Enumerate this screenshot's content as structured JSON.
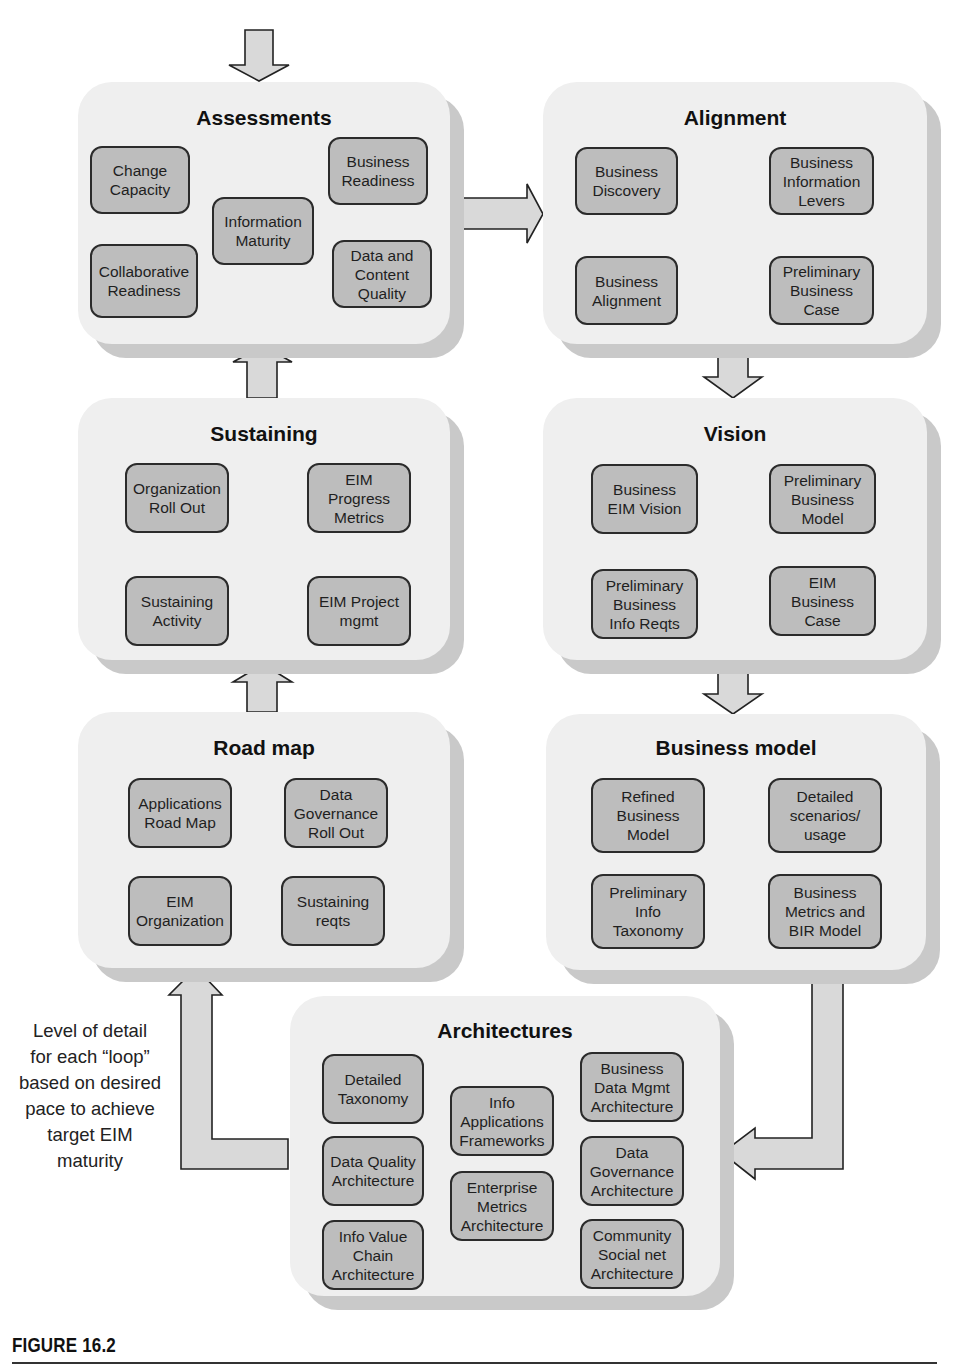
{
  "diagram": {
    "colors": {
      "panel_fill": "#efefef",
      "panel_shadow": "#c9c9c9",
      "node_fill": "#bdbdbd",
      "node_border": "#2b2b2b",
      "arrow_fill": "#d9d9d9",
      "arrow_stroke": "#222222"
    },
    "panels": {
      "assessments": {
        "title": "Assessments",
        "nodes": [
          "Change\nCapacity",
          "Collaborative\nReadiness",
          "Information\nMaturity",
          "Business\nReadiness",
          "Data and\nContent\nQuality"
        ]
      },
      "alignment": {
        "title": "Alignment",
        "nodes": [
          "Business\nDiscovery",
          "Business\nInformation\nLevers",
          "Business\nAlignment",
          "Preliminary\nBusiness\nCase"
        ]
      },
      "sustaining": {
        "title": "Sustaining",
        "nodes": [
          "Organization\nRoll Out",
          "EIM\nProgress\nMetrics",
          "Sustaining\nActivity",
          "EIM Project\nmgmt"
        ]
      },
      "vision": {
        "title": "Vision",
        "nodes": [
          "Business\nEIM Vision",
          "Preliminary\nBusiness\nModel",
          "Preliminary\nBusiness\nInfo Reqts",
          "EIM\nBusiness\nCase"
        ]
      },
      "roadmap": {
        "title": "Road map",
        "nodes": [
          "Applications\nRoad Map",
          "Data\nGovernance\nRoll Out",
          "EIM\nOrganization",
          "Sustaining\nreqts"
        ]
      },
      "business_model": {
        "title": "Business model",
        "nodes": [
          "Refined\nBusiness\nModel",
          "Detailed\nscenarios/\nusage",
          "Preliminary\nInfo\nTaxonomy",
          "Business\nMetrics and\nBIR Model"
        ]
      },
      "architectures": {
        "title": "Architectures",
        "nodes": [
          "Detailed\nTaxonomy",
          "Data Quality\nArchitecture",
          "Info Value\nChain\nArchitecture",
          "Info\nApplications\nFrameworks",
          "Enterprise\nMetrics\nArchitecture",
          "Business\nData Mgmt\nArchitecture",
          "Data\nGovernance\nArchitecture",
          "Community\nSocial net\nArchitecture"
        ]
      }
    },
    "flow": [
      "Assessments",
      "Alignment",
      "Vision",
      "Business model",
      "Architectures",
      "Road map",
      "Sustaining",
      "Assessments"
    ],
    "loop_note": "Level of detail\nfor each “loop”\nbased on desired\npace to achieve\ntarget EIM\nmaturity"
  },
  "caption": "FIGURE 16.2"
}
